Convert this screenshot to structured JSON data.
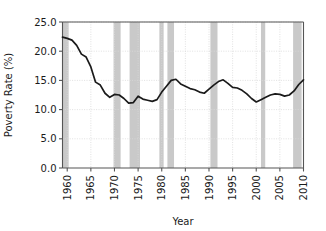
{
  "chart_data": {
    "type": "line",
    "title": "",
    "xlabel": "Year",
    "ylabel": "Poverty Rate (%)",
    "xlim": [
      1959,
      2010
    ],
    "ylim": [
      0.0,
      25.0
    ],
    "grid": true,
    "legend": null,
    "line_color": "#1a1a1a",
    "band_color": "#c9c9c9",
    "axis_color": "#555555",
    "grid_color": "#d9d9d9",
    "x_tick_labels": [
      "1960",
      "1965",
      "1970",
      "1975",
      "1980",
      "1985",
      "1990",
      "1995",
      "2000",
      "2005",
      "2010"
    ],
    "x_tick_values": [
      1960,
      1965,
      1970,
      1975,
      1980,
      1985,
      1990,
      1995,
      2000,
      2005,
      2010
    ],
    "y_tick_labels": [
      "0.0",
      "5.0",
      "10.0",
      "15.0",
      "20.0",
      "25.0"
    ],
    "y_tick_values": [
      0.0,
      5.0,
      10.0,
      15.0,
      20.0,
      25.0
    ],
    "series": [
      {
        "name": "Poverty Rate",
        "x": [
          1959,
          1960,
          1961,
          1962,
          1963,
          1964,
          1965,
          1966,
          1967,
          1968,
          1969,
          1970,
          1971,
          1972,
          1973,
          1974,
          1975,
          1976,
          1977,
          1978,
          1979,
          1980,
          1981,
          1982,
          1983,
          1984,
          1985,
          1986,
          1987,
          1988,
          1989,
          1990,
          1991,
          1992,
          1993,
          1994,
          1995,
          1996,
          1997,
          1998,
          1999,
          2000,
          2001,
          2002,
          2003,
          2004,
          2005,
          2006,
          2007,
          2008,
          2009,
          2010
        ],
        "values": [
          22.4,
          22.2,
          21.9,
          21.0,
          19.5,
          19.0,
          17.3,
          14.7,
          14.2,
          12.8,
          12.1,
          12.6,
          12.5,
          11.9,
          11.1,
          11.2,
          12.3,
          11.8,
          11.6,
          11.4,
          11.7,
          13.0,
          14.0,
          15.0,
          15.2,
          14.4,
          14.0,
          13.6,
          13.4,
          13.0,
          12.8,
          13.5,
          14.2,
          14.8,
          15.1,
          14.5,
          13.8,
          13.7,
          13.3,
          12.7,
          11.9,
          11.3,
          11.7,
          12.1,
          12.5,
          12.7,
          12.6,
          12.3,
          12.5,
          13.2,
          14.3,
          15.1
        ]
      }
    ],
    "shaded_bands": [
      {
        "label": "recession",
        "start": 1959.0,
        "end": 1960.3
      },
      {
        "label": "recession",
        "start": 1969.8,
        "end": 1971.3
      },
      {
        "label": "recession",
        "start": 1973.2,
        "end": 1975.4
      },
      {
        "label": "recession",
        "start": 1979.5,
        "end": 1980.4
      },
      {
        "label": "recession",
        "start": 1981.2,
        "end": 1982.6
      },
      {
        "label": "recession",
        "start": 1990.3,
        "end": 1991.8
      },
      {
        "label": "recession",
        "start": 2001.0,
        "end": 2001.9
      },
      {
        "label": "recession",
        "start": 2007.8,
        "end": 2009.6
      }
    ]
  }
}
